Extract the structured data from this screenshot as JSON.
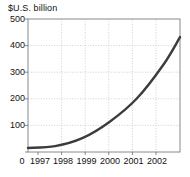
{
  "chart_data": {
    "type": "line",
    "title": "$U.S. billion",
    "subtitle": "",
    "xlabel": "",
    "ylabel": "",
    "x": [
      1997,
      1998,
      1999,
      2000,
      2001,
      2002
    ],
    "values": [
      15,
      22,
      52,
      113,
      200,
      330
    ],
    "series": [
      {
        "name": "$U.S. billion",
        "values": [
          15,
          22,
          52,
          113,
          200,
          330
        ],
        "color": "#3c3c3c"
      }
    ],
    "end_point": {
      "x": 2002.6,
      "y": 432
    },
    "xlim": [
      1997,
      2002.6
    ],
    "ylim": [
      0,
      500
    ],
    "ytick_values": [
      0,
      100,
      200,
      300,
      400,
      500
    ],
    "ytick_labels": [
      "0",
      "100",
      "200",
      "300",
      "400",
      "500"
    ],
    "xtick_values": [
      1997,
      1998,
      1999,
      2000,
      2001,
      2002
    ],
    "xtick_labels": [
      "1997",
      "1998",
      "1999",
      "2000",
      "2001",
      "2002"
    ],
    "origin_label": "0",
    "grid": true,
    "grid_style": "dotted",
    "legend": false,
    "legend_position": "none"
  },
  "colors": {
    "line": "#3c3c3c",
    "grid": "#bdbdbd",
    "frame": "#8a8a8a",
    "axis_text": "#111111",
    "background": "#ffffff"
  },
  "axis": {
    "y_labels": [
      "500",
      "400",
      "300",
      "200",
      "100"
    ],
    "x_labels": [
      "0",
      "1997",
      "1998",
      "1999",
      "2000",
      "2001",
      "2002"
    ]
  }
}
